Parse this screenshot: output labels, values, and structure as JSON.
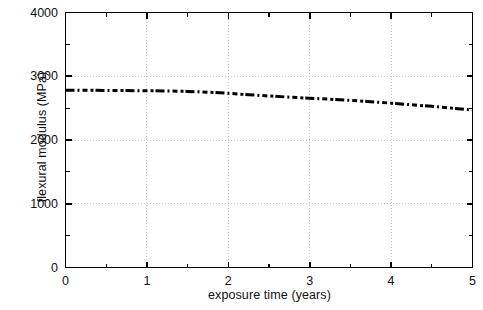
{
  "chart_data": {
    "type": "line",
    "title": "",
    "xlabel": "exposure time (years)",
    "ylabel": "flexural modulus (MPa)",
    "xlim": [
      0,
      5
    ],
    "ylim": [
      0,
      4000
    ],
    "xticks": [
      0,
      1,
      2,
      3,
      4,
      5
    ],
    "xtick_labels": [
      "0",
      "1",
      "2",
      "3",
      "4",
      "5"
    ],
    "yticks": [
      0,
      1000,
      2000,
      3000,
      4000
    ],
    "ytick_labels": [
      "0",
      "1000",
      "2000",
      "3000",
      "4000"
    ],
    "x_minor_tick_step": 0.5,
    "y_minor_tick_step": 500,
    "grid": "major-y-only",
    "legend": "none",
    "line_style": "dashed",
    "line_color": "#000000",
    "line_width_px": 3,
    "series": [
      {
        "name": "flexural modulus",
        "x": [
          0.0,
          0.25,
          0.5,
          0.75,
          1.0,
          1.25,
          1.5,
          1.75,
          2.0,
          2.25,
          2.5,
          2.75,
          3.0,
          3.25,
          3.5,
          3.75,
          4.0,
          4.25,
          4.5,
          4.75,
          5.0
        ],
        "values": [
          2780,
          2780,
          2778,
          2775,
          2772,
          2770,
          2762,
          2750,
          2732,
          2710,
          2690,
          2672,
          2655,
          2640,
          2622,
          2600,
          2578,
          2552,
          2528,
          2500,
          2470
        ]
      }
    ]
  },
  "figure": {
    "background_color": "#ffffff",
    "axes_color": "#000000",
    "grid_color": "#c9c9c9"
  }
}
